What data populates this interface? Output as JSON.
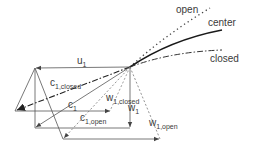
{
  "colors": {
    "background": "#ffffff",
    "line": "#555555",
    "curve": "#1a1a1a",
    "text": "#3a3a3a"
  },
  "curves": {
    "open": {
      "label": "open",
      "style": "dotted"
    },
    "center": {
      "label": "center",
      "style": "solid"
    },
    "closed": {
      "label": "closed",
      "style": "dash-dot"
    }
  },
  "vectors": {
    "u1": {
      "main": "u",
      "sub": "1"
    },
    "c1_closed": {
      "main": "c",
      "sub": "1,closed"
    },
    "c1": {
      "main": "c",
      "sub": "1"
    },
    "c1_open": {
      "main": "c",
      "sub": "1,open"
    },
    "w1_closed": {
      "main": "w",
      "sub": "1,closed"
    },
    "w1": {
      "main": "w",
      "sub": "1"
    },
    "w1_open": {
      "main": "w",
      "sub": "1,open"
    }
  }
}
